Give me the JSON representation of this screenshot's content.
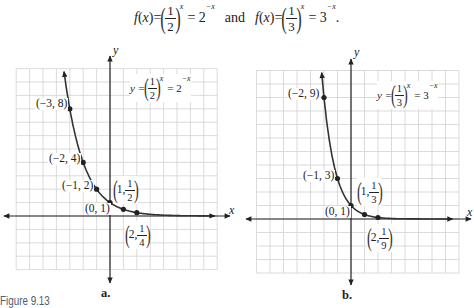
{
  "header": {
    "fn1": "f",
    "lp1": "(",
    "arg1": "x",
    "rp1": ")",
    "eq1": "=",
    "open1": "(",
    "num1": "1",
    "den1": "2",
    "close1": ")",
    "exp1": "x",
    "rhs1": "= 2",
    "rhsexp1": "−x",
    "conj": "and",
    "fn2": "f",
    "lp2": "(",
    "arg2": "x",
    "rp2": ")",
    "eq2": "=",
    "open2": "(",
    "num2": "1",
    "den2": "3",
    "close2": ")",
    "exp2": "x",
    "rhs2": "= 3",
    "rhsexp2": "−x",
    "end": "."
  },
  "figure_label": "Figure 9.13",
  "graphs": [
    {
      "panel": "a.",
      "x_axis": "x",
      "y_axis": "y",
      "equation": {
        "lhs": "y =",
        "open": "(",
        "num": "1",
        "den": "2",
        "close": ")",
        "exp": "x",
        "rhs": "= 2",
        "rhs_exp": "−x"
      },
      "labels": [
        {
          "text": "(−3, 8)"
        },
        {
          "text": "(−2, 4)"
        },
        {
          "text": "(−1, 2)"
        },
        {
          "text": "(0, 1)"
        },
        {
          "open": "(",
          "lead": "1,",
          "num": "1",
          "den": "2",
          "close": ")"
        },
        {
          "open": "(",
          "lead": "2,",
          "num": "1",
          "den": "4",
          "close": ")"
        }
      ]
    },
    {
      "panel": "b.",
      "x_axis": "x",
      "y_axis": "y",
      "equation": {
        "lhs": "y =",
        "open": "(",
        "num": "1",
        "den": "3",
        "close": ")",
        "exp": "x",
        "rhs": "= 3",
        "rhs_exp": "−x"
      },
      "labels": [
        {
          "text": "(−2, 9)"
        },
        {
          "text": "(−1, 3)"
        },
        {
          "text": "(0, 1)"
        },
        {
          "open": "(",
          "lead": "1,",
          "num": "1",
          "den": "3",
          "close": ")"
        },
        {
          "open": "(",
          "lead": "2,",
          "num": "1",
          "den": "9",
          "close": ")"
        }
      ]
    }
  ],
  "chart_data": [
    {
      "type": "line",
      "title": "a.",
      "function": "y = (1/2)^x = 2^-x",
      "xlabel": "x",
      "ylabel": "y",
      "xlim": [
        -7,
        8
      ],
      "ylim": [
        -4,
        11
      ],
      "grid": true,
      "curve": {
        "base": 0.5,
        "x0": -3.43,
        "x1": 7.84
      },
      "points": [
        {
          "x": -3,
          "y": 8,
          "label": "(−3, 8)"
        },
        {
          "x": -2,
          "y": 4,
          "label": "(−2, 4)"
        },
        {
          "x": -1,
          "y": 2,
          "label": "(−1, 2)"
        },
        {
          "x": 0,
          "y": 1,
          "label": "(0, 1)"
        },
        {
          "x": 1,
          "y": 0.5,
          "label": "(1, 1/2)"
        },
        {
          "x": 2,
          "y": 0.25,
          "label": "(2, 1/4)"
        }
      ],
      "series": [
        {
          "name": "y = 2^-x",
          "x": [
            -3,
            -2,
            -1,
            0,
            1,
            2
          ],
          "y": [
            8,
            4,
            2,
            1,
            0.5,
            0.25
          ]
        }
      ]
    },
    {
      "type": "line",
      "title": "b.",
      "function": "y = (1/3)^x = 3^-x",
      "xlabel": "x",
      "ylabel": "y",
      "xlim": [
        -7,
        8
      ],
      "ylim": [
        -4,
        11
      ],
      "grid": true,
      "curve": {
        "base": 0.3333333333,
        "x0": -2.17,
        "x1": 7.55
      },
      "points": [
        {
          "x": -2,
          "y": 9,
          "label": "(−2, 9)"
        },
        {
          "x": -1,
          "y": 3,
          "label": "(−1, 3)"
        },
        {
          "x": 0,
          "y": 1,
          "label": "(0, 1)"
        },
        {
          "x": 1,
          "y": 0.3333,
          "label": "(1, 1/3)"
        },
        {
          "x": 2,
          "y": 0.1111,
          "label": "(2, 1/9)"
        }
      ],
      "series": [
        {
          "name": "y = 3^-x",
          "x": [
            -2,
            -1,
            0,
            1,
            2
          ],
          "y": [
            9,
            3,
            1,
            0.3333,
            0.1111
          ]
        }
      ]
    }
  ]
}
